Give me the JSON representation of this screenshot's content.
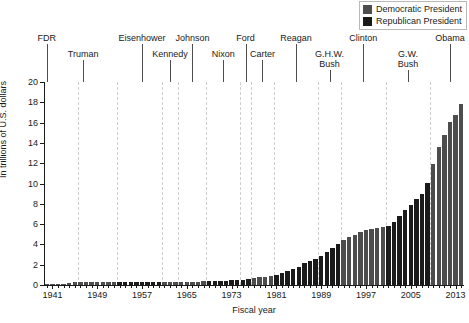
{
  "chart_data": {
    "type": "bar",
    "title": "",
    "xlabel": "Fiscal year",
    "ylabel": "In trillions of U.S. dollars",
    "ylim": [
      0,
      20
    ],
    "yticks": [
      0,
      2,
      4,
      6,
      8,
      10,
      12,
      14,
      16,
      18,
      20
    ],
    "xlim": [
      1939.5,
      2014.5
    ],
    "xticks": [
      1941,
      1949,
      1957,
      1965,
      1973,
      1981,
      1989,
      1997,
      2005,
      2013
    ],
    "xtick_labels": [
      "1941",
      "1949",
      "1957",
      "1965",
      "1973",
      "1981",
      "1989",
      "1997",
      "2005",
      "2013"
    ],
    "grid": false,
    "legend_position": "top-right",
    "series": [
      {
        "name": "Democratic President",
        "color": "#4d4d4d"
      },
      {
        "name": "Republican President",
        "color": "#1a1a1a"
      }
    ],
    "x": [
      1940,
      1941,
      1942,
      1943,
      1944,
      1945,
      1946,
      1947,
      1948,
      1949,
      1950,
      1951,
      1952,
      1953,
      1954,
      1955,
      1956,
      1957,
      1958,
      1959,
      1960,
      1961,
      1962,
      1963,
      1964,
      1965,
      1966,
      1967,
      1968,
      1969,
      1970,
      1971,
      1972,
      1973,
      1974,
      1975,
      1976,
      1977,
      1978,
      1979,
      1980,
      1981,
      1982,
      1983,
      1984,
      1985,
      1986,
      1987,
      1988,
      1989,
      1990,
      1991,
      1992,
      1993,
      1994,
      1995,
      1996,
      1997,
      1998,
      1999,
      2000,
      2001,
      2002,
      2003,
      2004,
      2005,
      2006,
      2007,
      2008,
      2009,
      2010,
      2011,
      2012,
      2013,
      2014
    ],
    "values": [
      0.05,
      0.06,
      0.08,
      0.14,
      0.2,
      0.26,
      0.27,
      0.26,
      0.25,
      0.25,
      0.26,
      0.26,
      0.26,
      0.27,
      0.27,
      0.27,
      0.27,
      0.27,
      0.28,
      0.29,
      0.29,
      0.29,
      0.3,
      0.31,
      0.32,
      0.32,
      0.33,
      0.34,
      0.35,
      0.37,
      0.38,
      0.41,
      0.44,
      0.47,
      0.48,
      0.54,
      0.63,
      0.71,
      0.78,
      0.83,
      0.91,
      1.0,
      1.14,
      1.37,
      1.56,
      1.82,
      2.12,
      2.35,
      2.6,
      2.86,
      3.23,
      3.67,
      4.06,
      4.41,
      4.69,
      4.97,
      5.22,
      5.41,
      5.53,
      5.66,
      5.67,
      5.81,
      6.23,
      6.78,
      7.38,
      7.93,
      8.51,
      9.01,
      10.02,
      11.91,
      13.56,
      14.79,
      16.07,
      16.74,
      17.82
    ],
    "party": [
      "D",
      "D",
      "D",
      "D",
      "D",
      "D",
      "D",
      "D",
      "D",
      "D",
      "D",
      "D",
      "D",
      "R",
      "R",
      "R",
      "R",
      "R",
      "R",
      "R",
      "R",
      "D",
      "D",
      "D",
      "D",
      "D",
      "D",
      "D",
      "D",
      "R",
      "R",
      "R",
      "R",
      "R",
      "R",
      "R",
      "R",
      "D",
      "D",
      "D",
      "D",
      "R",
      "R",
      "R",
      "R",
      "R",
      "R",
      "R",
      "R",
      "R",
      "R",
      "R",
      "R",
      "D",
      "D",
      "D",
      "D",
      "D",
      "D",
      "D",
      "D",
      "R",
      "R",
      "R",
      "R",
      "R",
      "R",
      "R",
      "R",
      "D",
      "D",
      "D",
      "D",
      "D",
      "D"
    ]
  },
  "legend": {
    "items": [
      {
        "label": "Democratic President",
        "color": "#4d4d4d"
      },
      {
        "label": "Republican President",
        "color": "#1a1a1a"
      }
    ]
  },
  "presidents": [
    {
      "name": "FDR",
      "lines": [
        "FDR"
      ],
      "year": 1940.0,
      "row": 0
    },
    {
      "name": "Truman",
      "lines": [
        "Truman"
      ],
      "year": 1946.5,
      "row": 1
    },
    {
      "name": "Eisenhower",
      "lines": [
        "Eisenhower"
      ],
      "year": 1957.0,
      "row": 0
    },
    {
      "name": "Kennedy",
      "lines": [
        "Kennedy"
      ],
      "year": 1962.0,
      "row": 1
    },
    {
      "name": "Johnson",
      "lines": [
        "Johnson"
      ],
      "year": 1966.0,
      "row": 0
    },
    {
      "name": "Nixon",
      "lines": [
        "Nixon"
      ],
      "year": 1971.5,
      "row": 1
    },
    {
      "name": "Ford",
      "lines": [
        "Ford"
      ],
      "year": 1975.5,
      "row": 0
    },
    {
      "name": "Carter",
      "lines": [
        "Carter"
      ],
      "year": 1978.5,
      "row": 1
    },
    {
      "name": "Reagan",
      "lines": [
        "Reagan"
      ],
      "year": 1984.5,
      "row": 0
    },
    {
      "name": "G.H.W. Bush",
      "lines": [
        "G.H.W.",
        "Bush"
      ],
      "year": 1990.5,
      "row": 1
    },
    {
      "name": "Clinton",
      "lines": [
        "Clinton"
      ],
      "year": 1996.5,
      "row": 0
    },
    {
      "name": "G.W. Bush",
      "lines": [
        "G.W.",
        "Bush"
      ],
      "year": 2004.5,
      "row": 1
    },
    {
      "name": "Obama",
      "lines": [
        "Obama"
      ],
      "year": 2012.0,
      "row": 0
    }
  ],
  "dividers": [
    1945.5,
    1952.5,
    1960.5,
    1963.5,
    1968.5,
    1974.5,
    1976.5,
    1980.5,
    1988.5,
    1992.5,
    2000.5,
    2008.5
  ]
}
